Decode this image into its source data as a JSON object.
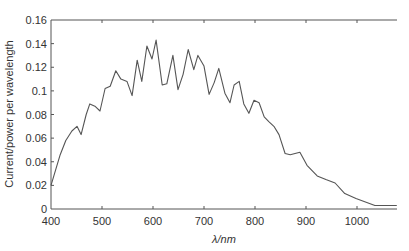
{
  "chart_data": {
    "type": "line",
    "title": "",
    "xlabel": "λ/nm",
    "ylabel": "Current/power per wavelength",
    "xlim": [
      400,
      1080
    ],
    "ylim": [
      0,
      0.16
    ],
    "grid": false,
    "legend": null,
    "x_ticks": [
      400,
      500,
      600,
      700,
      800,
      900,
      1000
    ],
    "x_tick_labels": [
      "400",
      "500",
      "600",
      "700",
      "800",
      "900",
      "1000"
    ],
    "y_ticks": [
      0,
      0.02,
      0.04,
      0.06,
      0.08,
      0.1,
      0.12,
      0.14,
      0.16
    ],
    "y_tick_labels": [
      "0",
      "0.02",
      "0.04",
      "0.06",
      "0.08",
      "0.1",
      "0.12",
      "0.14",
      "0.16"
    ],
    "series": [
      {
        "name": "Current/power per wavelength",
        "color": "#555555",
        "x": [
          400,
          418,
          429,
          441,
          451,
          459,
          469,
          476,
          486,
          496,
          506,
          516,
          527,
          537,
          549,
          559,
          569,
          578,
          588,
          598,
          606,
          618,
          627,
          639,
          649,
          659,
          669,
          680,
          688,
          700,
          710,
          720,
          729,
          741,
          751,
          759,
          769,
          778,
          788,
          798,
          808,
          818,
          827,
          837,
          847,
          859,
          869,
          888,
          902,
          922,
          939,
          957,
          976,
          998,
          1035,
          1078
        ],
        "values": [
          0.02,
          0.046,
          0.058,
          0.066,
          0.07,
          0.063,
          0.08,
          0.089,
          0.087,
          0.083,
          0.102,
          0.104,
          0.117,
          0.11,
          0.108,
          0.096,
          0.126,
          0.108,
          0.138,
          0.127,
          0.143,
          0.105,
          0.106,
          0.13,
          0.101,
          0.114,
          0.135,
          0.118,
          0.13,
          0.121,
          0.097,
          0.107,
          0.119,
          0.098,
          0.09,
          0.105,
          0.108,
          0.089,
          0.081,
          0.092,
          0.09,
          0.078,
          0.074,
          0.07,
          0.063,
          0.047,
          0.046,
          0.048,
          0.037,
          0.028,
          0.025,
          0.022,
          0.013,
          0.009,
          0.003,
          0.003
        ]
      }
    ]
  },
  "colors": {
    "axis": "#555555",
    "line": "#555555",
    "text": "#333333"
  }
}
